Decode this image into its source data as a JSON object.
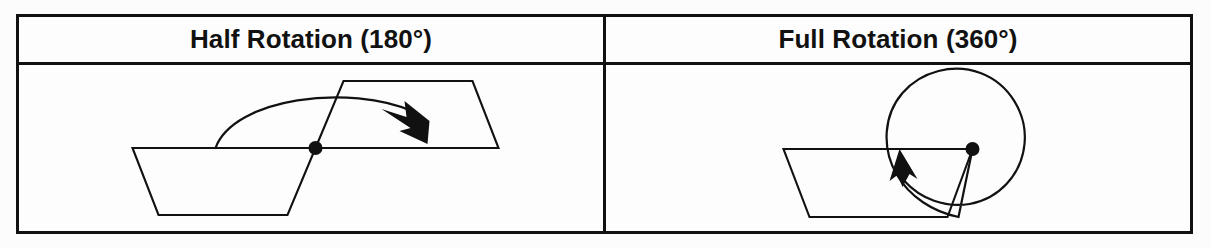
{
  "page": {
    "background_color": "#fcfcfc",
    "ink_color": "#111111"
  },
  "table": {
    "columns": [
      {
        "id": "half-rotation",
        "header": "Half Rotation (180°)",
        "diagram": {
          "name": "half-rotation-diagram",
          "description": "Trapezoid rotated 180 degrees about a pivot point with a curved arrow",
          "pivot_label": "pivot-point",
          "arrow_type": "curved-arc-arrow",
          "rotation_degrees": 180,
          "shape": "trapezoid",
          "shape_count": 2
        }
      },
      {
        "id": "full-rotation",
        "header": "Full Rotation (360°)",
        "diagram": {
          "name": "full-rotation-diagram",
          "description": "Trapezoid with a full circular arrow about a pivot point at its top-right corner",
          "pivot_label": "pivot-point",
          "arrow_type": "full-circle-arrow",
          "rotation_degrees": 360,
          "shape": "trapezoid",
          "shape_count": 1
        }
      }
    ]
  }
}
